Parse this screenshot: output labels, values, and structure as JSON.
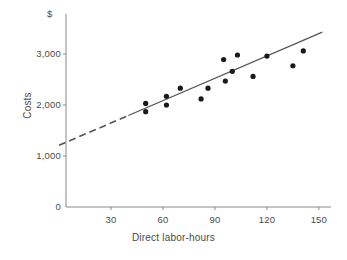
{
  "chart_data": {
    "type": "scatter",
    "title": "",
    "subtitle": "",
    "xlabel": "Direct labor-hours",
    "ylabel": "Costs",
    "y_unit_symbol": "$",
    "xlim": [
      0,
      160
    ],
    "ylim": [
      0,
      3500
    ],
    "grid": false,
    "legend": null,
    "x_ticks": [
      30,
      60,
      90,
      120,
      150
    ],
    "x_tick_labels": [
      "30",
      "60",
      "90",
      "120",
      "150"
    ],
    "y_ticks": [
      0,
      1000,
      2000,
      3000
    ],
    "y_tick_labels": [
      "0",
      "1,000",
      "2,000",
      "3,000"
    ],
    "series": [
      {
        "name": "Observed costs",
        "marker": "filled-circle",
        "color": "#1a1a1a",
        "points": [
          {
            "x": 50,
            "y": 2030
          },
          {
            "x": 50,
            "y": 1870
          },
          {
            "x": 62,
            "y": 2170
          },
          {
            "x": 62,
            "y": 2000
          },
          {
            "x": 70,
            "y": 2330
          },
          {
            "x": 82,
            "y": 2120
          },
          {
            "x": 86,
            "y": 2330
          },
          {
            "x": 95,
            "y": 2890
          },
          {
            "x": 96,
            "y": 2470
          },
          {
            "x": 100,
            "y": 2660
          },
          {
            "x": 103,
            "y": 2980
          },
          {
            "x": 112,
            "y": 2560
          },
          {
            "x": 120,
            "y": 2960
          },
          {
            "x": 135,
            "y": 2770
          },
          {
            "x": 141,
            "y": 3060
          }
        ]
      }
    ],
    "trendline": {
      "name": "Estimated cost line",
      "color": "#555555",
      "intercept": 1210,
      "slope": 14.6,
      "solid_from_x": 40,
      "solid_to_x": 152,
      "dashed_from_x": 0,
      "dashed_to_x": 40,
      "dash_note": "extrapolated below relevant range"
    },
    "axis_color": "#8a8a8a",
    "marker_radius_px": 2.6
  },
  "annotations": {
    "currency_symbol": "$"
  }
}
